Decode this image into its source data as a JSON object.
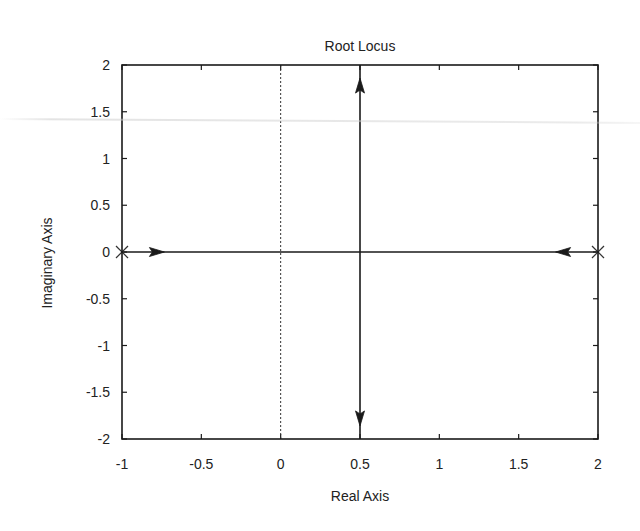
{
  "chart_data": {
    "type": "line",
    "title": "Root Locus",
    "xlabel": "Real Axis",
    "ylabel": "Imaginary Axis",
    "xlim": [
      -1,
      2
    ],
    "ylim": [
      -2,
      2
    ],
    "xticks": [
      -1,
      -0.5,
      0,
      0.5,
      1,
      1.5,
      2
    ],
    "xtick_labels": [
      "-1",
      "-0.5",
      "0",
      "0.5",
      "1",
      "1.5",
      "2"
    ],
    "yticks": [
      2,
      1.5,
      1,
      0.5,
      0,
      -0.5,
      -1,
      -1.5,
      -2
    ],
    "ytick_labels": [
      "2",
      "1.5",
      "1",
      "0.5",
      "0",
      "-0.5",
      "-1",
      "-1.5",
      "-2"
    ],
    "grid": false,
    "legend": null,
    "poles": [
      {
        "re": -1,
        "im": 0,
        "marker": "x"
      },
      {
        "re": 2,
        "im": 0,
        "marker": "x"
      }
    ],
    "zeros": [],
    "branches": [
      {
        "name": "real-axis segment",
        "points": [
          [
            -1,
            0
          ],
          [
            2,
            0
          ]
        ]
      },
      {
        "name": "upper branch",
        "points": [
          [
            0.5,
            0
          ],
          [
            0.5,
            2
          ]
        ]
      },
      {
        "name": "lower branch",
        "points": [
          [
            0.5,
            0
          ],
          [
            0.5,
            -2
          ]
        ]
      }
    ],
    "arrows": [
      {
        "at": [
          -0.78,
          0
        ],
        "direction": "right"
      },
      {
        "at": [
          1.78,
          0
        ],
        "direction": "left"
      },
      {
        "at": [
          0.5,
          1.78
        ],
        "direction": "up"
      },
      {
        "at": [
          0.5,
          -1.78
        ],
        "direction": "down"
      }
    ],
    "reference_lines": [
      {
        "orientation": "vertical",
        "x": 0,
        "style": "dotted"
      }
    ],
    "breakaway_point": {
      "re": 0.5,
      "im": 0
    }
  }
}
